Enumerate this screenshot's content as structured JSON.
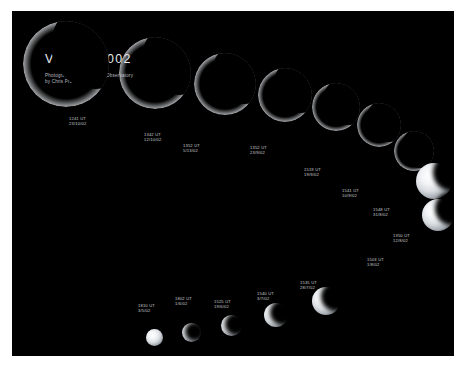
{
  "poster": {
    "title": "VENUS  2002",
    "credit_line_1": "Photographed at the TBGS Observatory",
    "credit_line_2": "by Chris Proctor",
    "frame_color": "#ffffff",
    "sky_color": "#000000",
    "label_color": "#c9ccd0"
  },
  "observations": [
    {
      "time": "1241 UT",
      "date": "23/10/02",
      "phase": "thin-crescent",
      "x": 11,
      "y": 10,
      "size": 86,
      "illum": 0.07,
      "label_x": 57,
      "label_y": 105
    },
    {
      "time": "1342 UT",
      "date": "12/10/02",
      "phase": "thin-crescent",
      "x": 107,
      "y": 26,
      "size": 72,
      "illum": 0.1,
      "label_x": 132,
      "label_y": 121
    },
    {
      "time": "1352 UT",
      "date": "5/13/02",
      "phase": "crescent",
      "x": 182,
      "y": 42,
      "size": 62,
      "illum": 0.14,
      "label_x": 171,
      "label_y": 132
    },
    {
      "time": "1352 UT",
      "date": "23/9/02",
      "phase": "crescent",
      "x": 246,
      "y": 57,
      "size": 54,
      "illum": 0.2,
      "label_x": 238,
      "label_y": 134
    },
    {
      "time": "1519 UT",
      "date": "19/9/02",
      "phase": "crescent",
      "x": 300,
      "y": 72,
      "size": 48,
      "illum": 0.27,
      "label_x": 292,
      "label_y": 156
    },
    {
      "time": "1541 UT",
      "date": "10/9/02",
      "phase": "crescent",
      "x": 345,
      "y": 92,
      "size": 44,
      "illum": 0.34,
      "label_x": 330,
      "label_y": 177
    },
    {
      "time": "1548 UT",
      "date": "31/8/02",
      "phase": "quarter",
      "x": 382,
      "y": 120,
      "size": 40,
      "illum": 0.42,
      "label_x": 361,
      "label_y": 196
    },
    {
      "time": "1350 UT",
      "date": "12/8/02",
      "phase": "quarter",
      "x": 404,
      "y": 152,
      "size": 36,
      "illum": 0.5,
      "label_x": 381,
      "label_y": 222
    },
    {
      "time": "1503 UT",
      "date": "1/8/02",
      "phase": "gibbous",
      "x": 410,
      "y": 188,
      "size": 32,
      "illum": 0.58,
      "label_x": 355,
      "label_y": 246
    },
    {
      "time": "1535 UT",
      "date": "28/7/02",
      "phase": "gibbous",
      "x": 300,
      "y": 276,
      "size": 28,
      "illum": 0.66,
      "label_x": 288,
      "label_y": 269
    },
    {
      "time": "1540 UT",
      "date": "3/7/02",
      "phase": "gibbous",
      "x": 252,
      "y": 292,
      "size": 24,
      "illum": 0.74,
      "label_x": 245,
      "label_y": 280
    },
    {
      "time": "1525 UT",
      "date": "19/6/02",
      "phase": "gibbous",
      "x": 209,
      "y": 304,
      "size": 21,
      "illum": 0.8,
      "label_x": 202,
      "label_y": 288
    },
    {
      "time": "1802 UT",
      "date": "1/6/02",
      "phase": "near-full",
      "x": 170,
      "y": 312,
      "size": 19,
      "illum": 0.86,
      "label_x": 163,
      "label_y": 285
    },
    {
      "time": "1810 UT",
      "date": "3/5/02",
      "phase": "near-full",
      "x": 134,
      "y": 318,
      "size": 17,
      "illum": 0.92,
      "label_x": 126,
      "label_y": 292
    }
  ]
}
